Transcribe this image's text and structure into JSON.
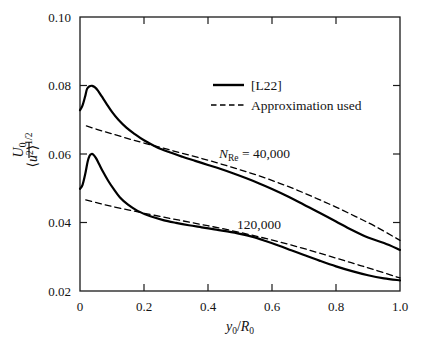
{
  "chart_data": {
    "type": "line",
    "title": "",
    "xlabel": "y0/R0",
    "ylabel": "<u^2>^1/2 / U0",
    "xlim": [
      0.0,
      1.0
    ],
    "ylim": [
      0.02,
      0.1
    ],
    "grid": false,
    "x_ticks": [
      "0",
      "0.2",
      "0.4",
      "0.6",
      "0.8",
      "1.0"
    ],
    "x_tick_values": [
      0.0,
      0.2,
      0.4,
      0.6,
      0.8,
      1.0
    ],
    "y_ticks": [
      "0.02",
      "0.04",
      "0.06",
      "0.08",
      "0.10"
    ],
    "y_tick_values": [
      0.02,
      0.04,
      0.06,
      0.08,
      0.1
    ],
    "legend_position": "upper-center",
    "legend": [
      {
        "label": "[L22]",
        "style": "solid"
      },
      {
        "label": "Approximation used",
        "style": "dashed"
      }
    ],
    "annotations": [
      {
        "text": "N_Re = 40,000",
        "x": 0.44,
        "y": 0.0595
      },
      {
        "text": "120,000",
        "x": 0.5,
        "y": 0.0405
      }
    ],
    "series": [
      {
        "name": "[L22] N_Re = 40,000",
        "style": "solid",
        "x": [
          0.0,
          0.008,
          0.016,
          0.022,
          0.03,
          0.038,
          0.046,
          0.056,
          0.068,
          0.082,
          0.1,
          0.12,
          0.145,
          0.17,
          0.2,
          0.24,
          0.28,
          0.32,
          0.36,
          0.4,
          0.44,
          0.48,
          0.52,
          0.56,
          0.6,
          0.65,
          0.7,
          0.75,
          0.8,
          0.85,
          0.9,
          0.95,
          1.0
        ],
        "y": [
          0.0728,
          0.0742,
          0.0768,
          0.079,
          0.0798,
          0.0799,
          0.0795,
          0.0785,
          0.0768,
          0.0748,
          0.0723,
          0.07,
          0.0677,
          0.0659,
          0.064,
          0.062,
          0.0605,
          0.0592,
          0.058,
          0.0568,
          0.0556,
          0.0543,
          0.0529,
          0.0514,
          0.0498,
          0.0476,
          0.0452,
          0.0428,
          0.0403,
          0.0378,
          0.0356,
          0.034,
          0.032
        ]
      },
      {
        "name": "Approximation used, N_Re = 40,000",
        "style": "dashed",
        "x": [
          0.02,
          0.06,
          0.1,
          0.15,
          0.2,
          0.26,
          0.32,
          0.38,
          0.44,
          0.5,
          0.56,
          0.62,
          0.68,
          0.74,
          0.8,
          0.86,
          0.92,
          1.0
        ],
        "y": [
          0.0682,
          0.067,
          0.0659,
          0.0645,
          0.0632,
          0.0617,
          0.0602,
          0.0587,
          0.0571,
          0.0554,
          0.0536,
          0.0516,
          0.0494,
          0.047,
          0.0445,
          0.0418,
          0.039,
          0.0348
        ]
      },
      {
        "name": "[L22] 120,000",
        "style": "solid",
        "x": [
          0.0,
          0.008,
          0.016,
          0.024,
          0.03,
          0.036,
          0.042,
          0.05,
          0.06,
          0.072,
          0.088,
          0.105,
          0.125,
          0.15,
          0.18,
          0.22,
          0.26,
          0.3,
          0.34,
          0.38,
          0.42,
          0.46,
          0.5,
          0.54,
          0.58,
          0.62,
          0.66,
          0.7,
          0.75,
          0.8,
          0.85,
          0.9,
          0.95,
          1.0
        ],
        "y": [
          0.0498,
          0.051,
          0.054,
          0.0578,
          0.0595,
          0.06,
          0.0598,
          0.0588,
          0.057,
          0.0548,
          0.0522,
          0.0498,
          0.0473,
          0.0452,
          0.0434,
          0.0418,
          0.0407,
          0.0399,
          0.0392,
          0.0386,
          0.038,
          0.0374,
          0.0367,
          0.0358,
          0.0346,
          0.0333,
          0.0319,
          0.0305,
          0.0288,
          0.0272,
          0.0258,
          0.0246,
          0.0237,
          0.0231
        ]
      },
      {
        "name": "Approximation used, 120,000",
        "style": "dashed",
        "x": [
          0.018,
          0.06,
          0.1,
          0.15,
          0.2,
          0.26,
          0.32,
          0.38,
          0.44,
          0.5,
          0.56,
          0.62,
          0.68,
          0.74,
          0.8,
          0.86,
          0.92,
          1.0
        ],
        "y": [
          0.0466,
          0.0456,
          0.0447,
          0.0437,
          0.0427,
          0.0416,
          0.0405,
          0.0394,
          0.0383,
          0.0371,
          0.0358,
          0.0344,
          0.0329,
          0.0313,
          0.0296,
          0.0279,
          0.0262,
          0.0238
        ]
      }
    ]
  },
  "axis_titles": {
    "y_numerator_open": "<",
    "y_numerator_var": "u",
    "y_numerator_power": "2",
    "y_numerator_close": ">",
    "y_exponent": "1/2",
    "y_denominator_var": "U",
    "y_denominator_sub": "0",
    "x_var1": "y",
    "x_sub1": "0",
    "x_slash": "/",
    "x_var2": "R",
    "x_sub2": "0"
  },
  "annotation_text": {
    "re_label_n": "N",
    "re_label_sub": "Re",
    "re_label_eq": " = 40,000",
    "re_label_full": "N_Re = 40,000",
    "second_curve": "120,000"
  },
  "colors": {
    "axis": "#1a1a1a",
    "curve": "#000000",
    "background": "#ffffff",
    "text": "#131313"
  }
}
